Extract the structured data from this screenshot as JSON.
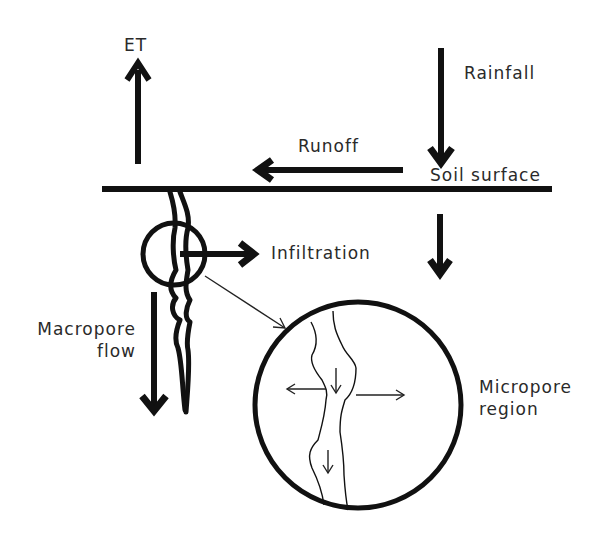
{
  "diagram": {
    "title": "",
    "labels": {
      "et": "ET",
      "rainfall": "Rainfall",
      "runoff": "Runoff",
      "soil_surface": "Soil surface",
      "infiltration": "Infiltration",
      "macropore_line1": "Macropore",
      "macropore_line2": "flow",
      "micropore_line1": "Micropore",
      "micropore_line2": "region"
    },
    "nodes": [
      {
        "id": "et",
        "label": "ET",
        "type": "flux-up"
      },
      {
        "id": "rainfall",
        "label": "Rainfall",
        "type": "flux-down"
      },
      {
        "id": "runoff",
        "label": "Runoff",
        "type": "flux-left"
      },
      {
        "id": "soil_surface",
        "label": "Soil surface",
        "type": "boundary-line"
      },
      {
        "id": "infiltration",
        "label": "Infiltration",
        "type": "flux-right"
      },
      {
        "id": "macropore",
        "label": "Macropore flow",
        "type": "flux-down"
      },
      {
        "id": "micropore",
        "label": "Micropore region",
        "type": "magnified-circle"
      }
    ],
    "edges": [
      {
        "from": "atmosphere",
        "to": "soil_surface",
        "label": "Rainfall"
      },
      {
        "from": "soil_surface",
        "to": "atmosphere",
        "label": "ET"
      },
      {
        "from": "soil_surface",
        "to": "runoff",
        "label": "Runoff"
      },
      {
        "from": "macropore",
        "to": "soil_matrix",
        "label": "Infiltration"
      },
      {
        "from": "macropore_wall",
        "to": "micropore",
        "label": "zoom-in"
      }
    ],
    "colors": {
      "ink": "#111111",
      "text": "#2a2a2a",
      "background": "#ffffff"
    }
  }
}
